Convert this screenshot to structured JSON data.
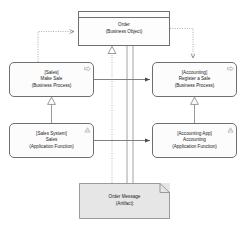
{
  "diagram": {
    "notation": "ArchiMate / UML",
    "background_color": "#ffffff",
    "line_color": "#6f6f6f",
    "text_color": "#1a1a1a",
    "artifact_fill": "#e6e6e6",
    "element_fill": "#fcfcfc"
  },
  "nodes": [
    {
      "id": "order",
      "name": "order-business-object",
      "shape": "business-object",
      "icon": "business-object-icon",
      "lines": [
        "Order",
        "(Business Object)"
      ],
      "x": 78,
      "y": 11,
      "w": 92,
      "h": 35
    },
    {
      "id": "make_sale",
      "name": "make-sale-business-process",
      "shape": "rounded-rectangle",
      "icon": "business-process-arrow-icon",
      "lines": [
        "[Sales]",
        "Make Sale",
        "(Business Process)"
      ],
      "x": 9,
      "y": 62,
      "w": 85,
      "h": 35
    },
    {
      "id": "register_sale",
      "name": "register-a-sale-business-process",
      "shape": "rounded-rectangle",
      "icon": "business-process-arrow-icon",
      "lines": [
        "[Accounting]",
        "Register a Sale",
        "(Business Process)"
      ],
      "x": 152,
      "y": 62,
      "w": 85,
      "h": 35
    },
    {
      "id": "sales_fn",
      "name": "sales-application-function",
      "shape": "rounded-rectangle",
      "icon": "application-function-icon",
      "lines": [
        "[Sales System]",
        "Sales",
        "(Application Function)"
      ],
      "x": 9,
      "y": 123,
      "w": 85,
      "h": 35
    },
    {
      "id": "accounting_fn",
      "name": "accounting-application-function",
      "shape": "rounded-rectangle",
      "icon": "application-function-icon",
      "lines": [
        "[Accounting App]",
        "Accounting",
        "(Application Function)"
      ],
      "x": 152,
      "y": 123,
      "w": 85,
      "h": 35
    },
    {
      "id": "order_message",
      "name": "order-message-artifact",
      "shape": "artifact",
      "icon": "artifact-folded-corner-icon",
      "lines": [
        "Order Message",
        "(Artifact)"
      ],
      "x": 79,
      "y": 183,
      "w": 91,
      "h": 36
    }
  ],
  "edges": [
    {
      "id": "e1",
      "name": "make-sale-accesses-order",
      "from": "make_sale",
      "to": "order",
      "style": "dotted",
      "arrow": "open-arrow",
      "label": ""
    },
    {
      "id": "e2",
      "name": "register-a-sale-accesses-order",
      "from": "order",
      "to": "register_sale",
      "style": "dotted",
      "arrow": "open-arrow",
      "label": ""
    },
    {
      "id": "e3",
      "name": "make-sale-triggers-register-a-sale",
      "from": "make_sale",
      "to": "register_sale",
      "style": "solid",
      "arrow": "filled-arrow",
      "label": ""
    },
    {
      "id": "e4",
      "name": "sales-flows-to-accounting",
      "from": "sales_fn",
      "to": "accounting_fn",
      "style": "solid",
      "arrow": "filled-arrow",
      "label": ""
    },
    {
      "id": "e5",
      "name": "sales-realizes-make-sale",
      "from": "sales_fn",
      "to": "make_sale",
      "style": "solid",
      "arrow": "hollow-triangle",
      "label": ""
    },
    {
      "id": "e6",
      "name": "accounting-realizes-register-a-sale",
      "from": "accounting_fn",
      "to": "register_sale",
      "style": "solid",
      "arrow": "hollow-triangle",
      "label": ""
    },
    {
      "id": "e7",
      "name": "order-message-realizes-order",
      "from": "order_message",
      "to": "order",
      "style": "dotted",
      "arrow": "hollow-triangle",
      "label": ""
    },
    {
      "id": "e8",
      "name": "order-message-association-left",
      "from": "order_message",
      "to": "order",
      "style": "solid",
      "arrow": "none",
      "label": ""
    },
    {
      "id": "e9",
      "name": "order-message-association-right",
      "from": "order_message",
      "to": "order",
      "style": "solid",
      "arrow": "none",
      "label": ""
    }
  ]
}
